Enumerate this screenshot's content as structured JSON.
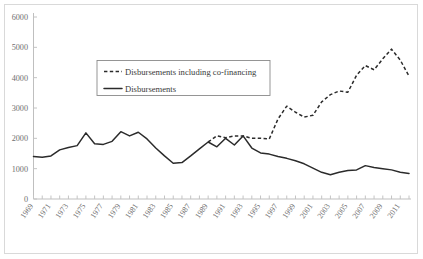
{
  "chart_data": {
    "type": "line",
    "title": "",
    "xlabel": "",
    "ylabel": "",
    "xlim": [
      1969,
      2012
    ],
    "ylim": [
      0,
      6000
    ],
    "grid": false,
    "legend_position": "upper-left-inside",
    "y_ticks": [
      "0",
      "1000",
      "2000",
      "3000",
      "4000",
      "5000",
      "6000"
    ],
    "y_tick_values": [
      0,
      1000,
      2000,
      3000,
      4000,
      5000,
      6000
    ],
    "x_tick_labels": [
      "1969",
      "1971",
      "1973",
      "1975",
      "1977",
      "1979",
      "1981",
      "1983",
      "1985",
      "1987",
      "1989",
      "1991",
      "1993",
      "1995",
      "1997",
      "1999",
      "2001",
      "2003",
      "2005",
      "2007",
      "2009",
      "2011"
    ],
    "x": [
      1969,
      1970,
      1971,
      1972,
      1973,
      1974,
      1975,
      1976,
      1977,
      1978,
      1979,
      1980,
      1981,
      1982,
      1983,
      1984,
      1985,
      1986,
      1987,
      1988,
      1989,
      1990,
      1991,
      1992,
      1993,
      1994,
      1995,
      1996,
      1997,
      1998,
      1999,
      2000,
      2001,
      2002,
      2003,
      2004,
      2005,
      2006,
      2007,
      2008,
      2009,
      2010,
      2011,
      2012
    ],
    "series": [
      {
        "name": "Disbursements",
        "style": "solid",
        "color": "#2b2b2b",
        "values": [
          1400,
          1380,
          1420,
          1620,
          1700,
          1760,
          2180,
          1820,
          1800,
          1900,
          2220,
          2080,
          2200,
          1980,
          1680,
          1420,
          1180,
          1200,
          1420,
          1650,
          1880,
          1720,
          2000,
          1780,
          2080,
          1680,
          1520,
          1480,
          1400,
          1340,
          1260,
          1160,
          1020,
          880,
          800,
          880,
          940,
          960,
          1100,
          1040,
          1000,
          960,
          880,
          840
        ]
      },
      {
        "name": "Disbursements including co-financing",
        "style": "dashed",
        "color": "#2b2b2b",
        "values": [
          null,
          null,
          null,
          null,
          null,
          null,
          null,
          null,
          null,
          null,
          null,
          null,
          null,
          null,
          null,
          null,
          null,
          null,
          null,
          null,
          1880,
          2080,
          2020,
          2080,
          2080,
          2000,
          2000,
          1980,
          2640,
          3060,
          2860,
          2700,
          2760,
          3200,
          3440,
          3560,
          3520,
          4080,
          4400,
          4260,
          4620,
          4940,
          4580,
          4050
        ]
      }
    ]
  },
  "legend": {
    "entries": [
      {
        "label": "Disbursements including co-financing",
        "style": "dashed"
      },
      {
        "label": "Disbursements",
        "style": "solid"
      }
    ]
  }
}
